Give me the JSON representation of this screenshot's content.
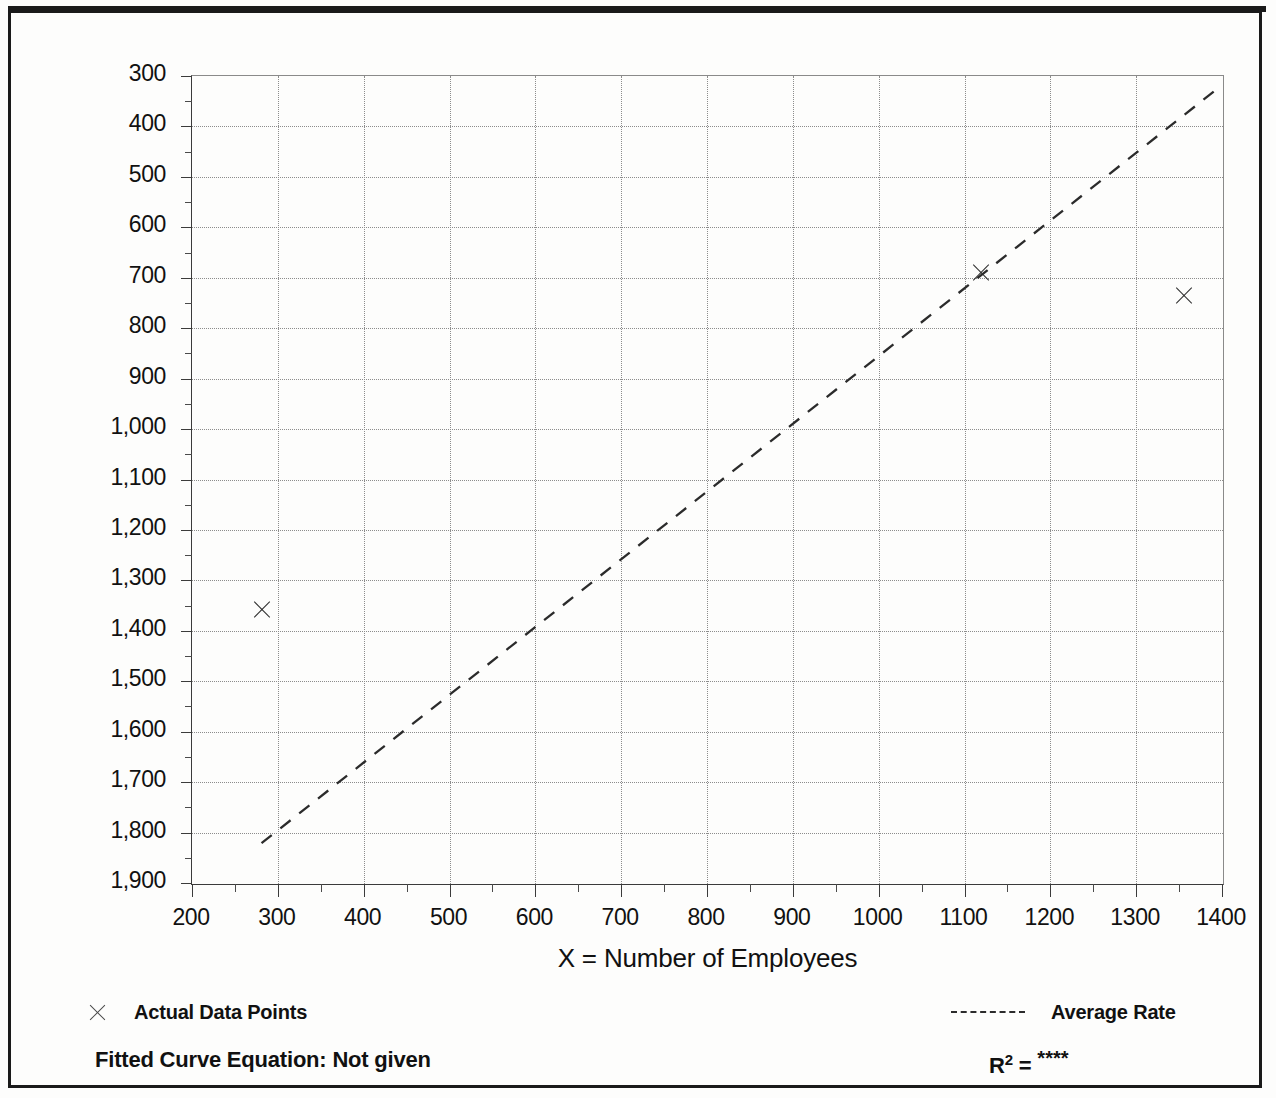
{
  "figure": {
    "background_color": "#fdfdfc",
    "border_color": "#1a1a1a",
    "clipped_title_note": ""
  },
  "axes": {
    "y_title": "T = Average Vehicle Trip Ends",
    "x_title": "X = Number of Employees",
    "y_ticks": [
      "1,900",
      "1,800",
      "1,700",
      "1,600",
      "1,500",
      "1,400",
      "1,300",
      "1,200",
      "1,100",
      "1,000",
      "900",
      "800",
      "700",
      "600",
      "500",
      "400",
      "300"
    ],
    "x_ticks": [
      "200",
      "300",
      "400",
      "500",
      "600",
      "700",
      "800",
      "900",
      "1000",
      "1100",
      "1200",
      "1300",
      "1400"
    ]
  },
  "legend": {
    "data_points_label": "Actual Data Points",
    "average_rate_label": "Average Rate",
    "marker_icon": "x-marker-icon",
    "line_icon": "dashed-line-icon"
  },
  "footer": {
    "fitted_equation_label": "Fitted Curve Equation:  Not given",
    "r_squared_label": "R",
    "r_squared_exponent": "2",
    "r_squared_equals": " = ",
    "r_squared_value": "****"
  },
  "chart_data": {
    "type": "scatter",
    "title": "",
    "xlabel": "X = Number of Employees",
    "ylabel": "T = Average Vehicle Trip Ends",
    "xlim": [
      200,
      1400
    ],
    "ylim": [
      300,
      1900
    ],
    "xticks": [
      200,
      300,
      400,
      500,
      600,
      700,
      800,
      900,
      1000,
      1100,
      1200,
      1300,
      1400
    ],
    "yticks": [
      300,
      400,
      500,
      600,
      700,
      800,
      900,
      1000,
      1100,
      1200,
      1300,
      1400,
      1500,
      1600,
      1700,
      1800,
      1900
    ],
    "minor_ticks": true,
    "grid": true,
    "grid_style": "dotted",
    "legend_position": "below-plot",
    "series": [
      {
        "name": "Actual Data Points",
        "type": "scatter",
        "marker": "x",
        "color": "#2b2b2b",
        "points": [
          {
            "x": 281,
            "y": 842
          },
          {
            "x": 1119,
            "y": 1510
          },
          {
            "x": 1356,
            "y": 1463
          }
        ]
      },
      {
        "name": "Average Rate",
        "type": "line",
        "style": "dashed",
        "color": "#2b2b2b",
        "points": [
          {
            "x": 281,
            "y": 379
          },
          {
            "x": 1400,
            "y": 1882
          }
        ],
        "note": "Line through origin representing the average trip rate"
      }
    ]
  }
}
